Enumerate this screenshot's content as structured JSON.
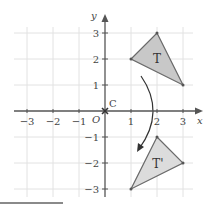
{
  "diagram": {
    "axes": {
      "x_label": "x",
      "y_label": "y",
      "origin_label": "O",
      "x_ticks": [
        "−3",
        "−2",
        "−1",
        "1",
        "2",
        "3"
      ],
      "y_ticks": [
        "3",
        "2",
        "1",
        "−1",
        "−2",
        "−3"
      ],
      "range": {
        "x": [
          -3,
          3
        ],
        "y": [
          -3,
          3
        ]
      }
    },
    "center": {
      "label": "C",
      "point": [
        0,
        0
      ]
    },
    "shapes": [
      {
        "label": "T",
        "vertices": [
          [
            1,
            2
          ],
          [
            2,
            3
          ],
          [
            3,
            1
          ]
        ],
        "fill": "#c8c8c8"
      },
      {
        "label": "T'",
        "vertices": [
          [
            2,
            -1
          ],
          [
            3,
            -2
          ],
          [
            1,
            -3
          ]
        ],
        "fill": "#dcdcdc"
      }
    ],
    "transformation": "rotation 90° clockwise about C",
    "colors": {
      "grid": "#e2e2e2",
      "axis": "#555555",
      "stroke": "#6a6a6a"
    }
  }
}
